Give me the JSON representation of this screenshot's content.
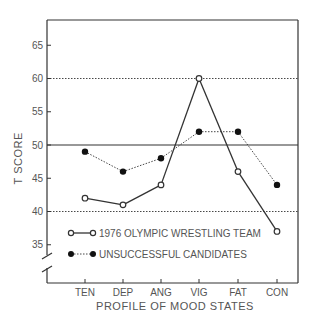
{
  "chart_data": {
    "type": "line",
    "title": "",
    "xlabel": "PROFILE OF MOOD STATES",
    "ylabel": "T SCORE",
    "categories": [
      "TEN",
      "DEP",
      "ANG",
      "VIG",
      "FAT",
      "CON"
    ],
    "series": [
      {
        "name": "1976 OLYMPIC WRESTLING TEAM",
        "marker": "open-circle",
        "line": "solid",
        "values": [
          42,
          41,
          44,
          60,
          46,
          37
        ]
      },
      {
        "name": "UNSUCCESSFUL CANDIDATES",
        "marker": "filled-circle",
        "line": "dotted",
        "values": [
          49,
          46,
          48,
          52,
          52,
          44
        ]
      }
    ],
    "yticks": [
      35,
      40,
      45,
      50,
      55,
      60,
      65
    ],
    "ylim": [
      33,
      68
    ],
    "reference_lines": [
      {
        "y": 60,
        "style": "dotted"
      },
      {
        "y": 50,
        "style": "solid"
      },
      {
        "y": 40,
        "style": "dotted"
      }
    ],
    "axis_break": true,
    "legend_position": "inside-bottom-left",
    "grid": false
  }
}
